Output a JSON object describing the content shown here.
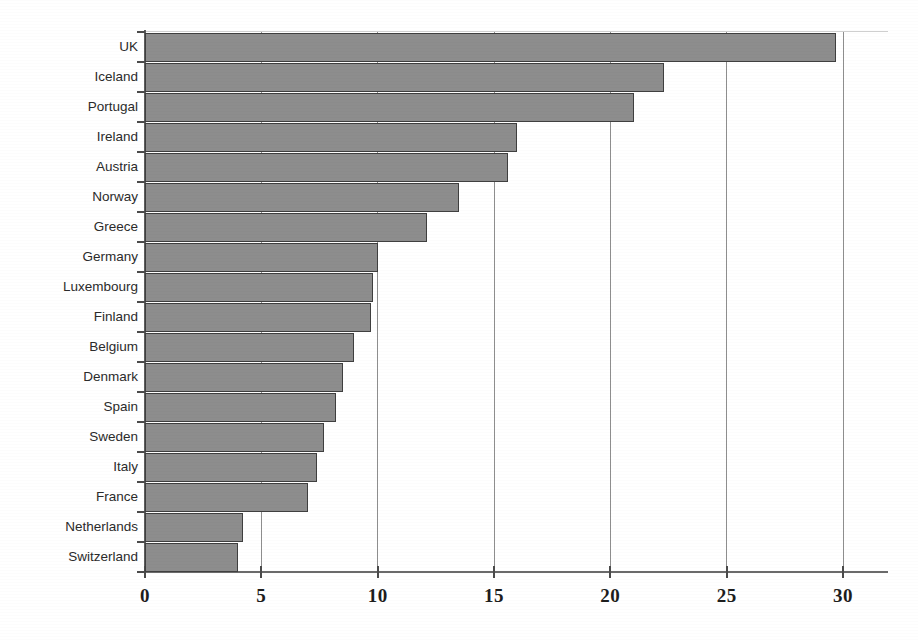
{
  "chart_data": {
    "type": "bar",
    "orientation": "horizontal",
    "title": "",
    "subtitle": "",
    "xlabel": "",
    "ylabel": "",
    "categories": [
      "UK",
      "Iceland",
      "Portugal",
      "Ireland",
      "Austria",
      "Norway",
      "Greece",
      "Germany",
      "Luxembourg",
      "Finland",
      "Belgium",
      "Denmark",
      "Spain",
      "Sweden",
      "Italy",
      "France",
      "Netherlands",
      "Switzerland"
    ],
    "values": [
      29.7,
      22.3,
      21.0,
      16.0,
      15.6,
      13.5,
      12.1,
      10.0,
      9.8,
      9.7,
      9.0,
      8.5,
      8.2,
      7.7,
      7.4,
      7.0,
      4.2,
      4.0
    ],
    "xticks": [
      0,
      5,
      10,
      15,
      20,
      25,
      30
    ],
    "xtick_labels": [
      "0",
      "5",
      "10",
      "15",
      "20",
      "25",
      "30"
    ],
    "xlim": [
      0,
      30
    ],
    "grid": true,
    "grid_axis": "x",
    "legend": false,
    "bar_color": "#8d8d8d",
    "bar_edge_color": "#3f3f3f",
    "axis_color": "#4a4a4a",
    "gridline_color": "#8e8e8e",
    "text_color": "#2b2b2b"
  }
}
